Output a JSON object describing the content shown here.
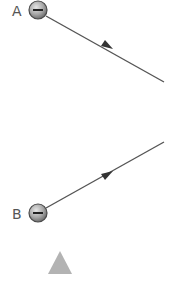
{
  "labels": {
    "a": "A",
    "b": "B"
  },
  "charges": {
    "a": "negative",
    "b": "negative"
  },
  "colors": {
    "line": "#555555",
    "charge_fill_light": "#dcdcdc",
    "charge_fill_dark": "#7a7a7a",
    "charge_stroke": "#4a4a4a",
    "triangle": "#b3b3b3"
  }
}
